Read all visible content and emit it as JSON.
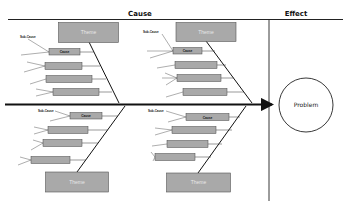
{
  "header": {
    "cause_label": "Cause",
    "effect_label": "Effect"
  },
  "effect": {
    "problem_label": "Problem"
  },
  "branches": [
    {
      "position": "top-left",
      "theme_label": "Theme",
      "sub_cause_label": "Sub-Cause",
      "causes": [
        "Cause",
        "",
        "",
        ""
      ]
    },
    {
      "position": "top-right",
      "theme_label": "Theme",
      "sub_cause_label": "Sub-Cause",
      "causes": [
        "Cause",
        "",
        "",
        ""
      ]
    },
    {
      "position": "bottom-left",
      "theme_label": "Theme",
      "sub_cause_label": "Sub-Cause",
      "causes": [
        "Cause",
        "",
        "",
        ""
      ]
    },
    {
      "position": "bottom-right",
      "theme_label": "Theme",
      "sub_cause_label": "Sub-Cause",
      "causes": [
        "Cause",
        "",
        "",
        ""
      ]
    }
  ],
  "colors": {
    "box_fill": "#a9a9a9",
    "box_stroke": "#555555",
    "line": "#111111",
    "background": "#ffffff"
  }
}
